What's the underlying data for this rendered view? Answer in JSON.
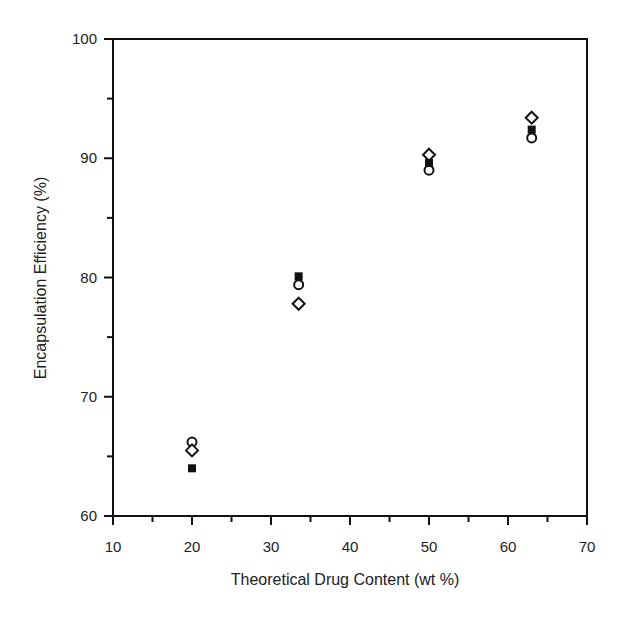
{
  "chart_data": {
    "type": "scatter",
    "title": "",
    "xlabel": "Theoretical Drug Content (wt %)",
    "ylabel": "Encapsulation Efficiency (%)",
    "xlim": [
      10,
      70
    ],
    "ylim": [
      60,
      100
    ],
    "x_ticks": [
      10,
      20,
      30,
      40,
      50,
      60,
      70
    ],
    "y_ticks": [
      60,
      70,
      80,
      90,
      100
    ],
    "x_minor_ticks": [
      15,
      25,
      35,
      45,
      55,
      65
    ],
    "y_minor_ticks": [
      65,
      75,
      85,
      95
    ],
    "grid": false,
    "legend": null,
    "series": [
      {
        "name": "open-circle",
        "marker": "circle-open",
        "x": [
          20,
          33.5,
          50,
          63
        ],
        "y": [
          66.2,
          79.4,
          89.0,
          91.7
        ]
      },
      {
        "name": "open-diamond",
        "marker": "diamond-open",
        "x": [
          20,
          33.5,
          50,
          63
        ],
        "y": [
          65.5,
          77.8,
          90.3,
          93.4
        ]
      },
      {
        "name": "filled-square",
        "marker": "square-filled",
        "x": [
          20,
          33.5,
          50,
          63
        ],
        "y": [
          64.0,
          80.1,
          89.6,
          92.4
        ]
      }
    ]
  },
  "labels": {
    "x_axis_title": "Theoretical Drug Content (wt %)",
    "y_axis_title": "Encapsulation Efficiency (%)"
  },
  "colors": {
    "ink": "#111111",
    "background": "#ffffff"
  }
}
